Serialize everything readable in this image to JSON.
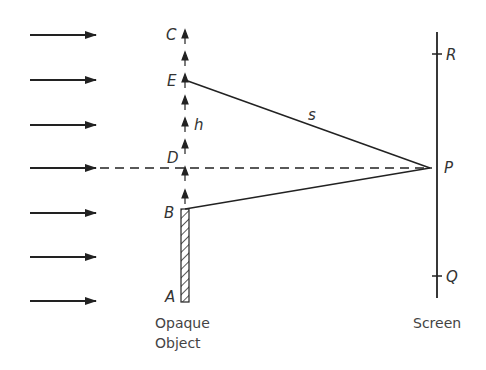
{
  "diagram": {
    "points": {
      "A": "A",
      "B": "B",
      "C": "C",
      "D": "D",
      "E": "E",
      "P": "P",
      "Q": "Q",
      "R": "R"
    },
    "segment_labels": {
      "h": "h",
      "s": "s"
    },
    "captions": {
      "object_line1": "Opaque",
      "object_line2": "Object",
      "screen": "Screen"
    },
    "incident_arrows_y": [
      35,
      80,
      125,
      168,
      213,
      257,
      301
    ],
    "wavefront_arrows_y": [
      37,
      60,
      82,
      104,
      126,
      148,
      175,
      198
    ],
    "colors": {
      "stroke": "#222222",
      "text": "#333333",
      "background": "#ffffff"
    }
  }
}
